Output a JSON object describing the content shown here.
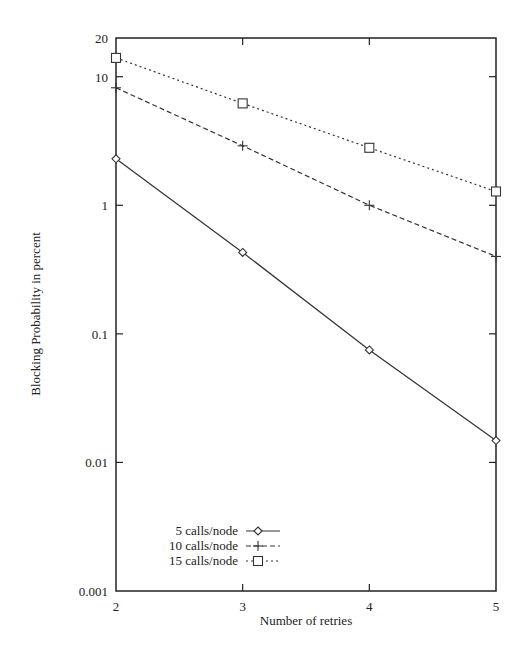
{
  "chart_data": {
    "type": "line",
    "title": "",
    "xlabel": "Number of retries",
    "ylabel": "Blocking Probability in percent",
    "x": [
      2,
      3,
      4,
      5
    ],
    "xlim": [
      2,
      5
    ],
    "ylim": [
      0.001,
      20
    ],
    "yscale": "log",
    "x_ticks": [
      "2",
      "3",
      "4",
      "5"
    ],
    "y_ticks": [
      "0.001",
      "0.01",
      "0.1",
      "1",
      "10",
      "20"
    ],
    "grid": false,
    "legend_position": "lower left",
    "series": [
      {
        "name": "5 calls/node",
        "marker": "diamond",
        "linestyle": "solid",
        "values": [
          2.3,
          0.43,
          0.075,
          0.0148
        ]
      },
      {
        "name": "10 calls/node",
        "marker": "plus",
        "linestyle": "dashed",
        "values": [
          8.2,
          2.9,
          1.0,
          0.4
        ]
      },
      {
        "name": "15 calls/node",
        "marker": "square",
        "linestyle": "dotted",
        "values": [
          14.0,
          6.2,
          2.8,
          1.28
        ]
      }
    ]
  },
  "colors": {
    "line": "#333333",
    "axis": "#222222",
    "background": "#ffffff"
  }
}
